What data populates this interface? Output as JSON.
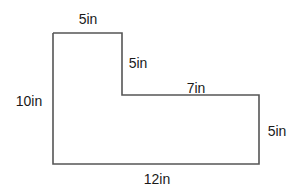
{
  "diagram": {
    "type": "L-shaped polygon with dimension labels",
    "stroke_color": "#555555",
    "label_color": "#1a1a1a",
    "labels": {
      "top": "5in",
      "notch_vertical": "5in",
      "notch_horizontal": "7in",
      "left": "10in",
      "right": "5in",
      "bottom": "12in"
    }
  }
}
